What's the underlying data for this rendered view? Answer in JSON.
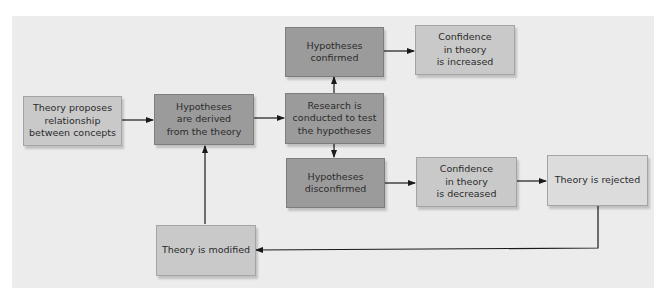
{
  "diagram": {
    "type": "flowchart",
    "colors": {
      "panel_background": "#ececec",
      "light_box": "#c9c9c9",
      "dark_box": "#9b9b9b",
      "lighter_box": "#dcdcdc",
      "arrow": "#1a1a1a",
      "text": "#2b2b2b"
    },
    "nodes": [
      {
        "id": "theory_proposes",
        "label": "Theory proposes\nrelationship\nbetween concepts",
        "style": "light"
      },
      {
        "id": "hypotheses_derived",
        "label": "Hypotheses\nare derived\nfrom the theory",
        "style": "dark"
      },
      {
        "id": "research_conducted",
        "label": "Research is\nconducted to test\nthe hypotheses",
        "style": "dark"
      },
      {
        "id": "hypotheses_confirmed",
        "label": "Hypotheses\nconfirmed",
        "style": "dark"
      },
      {
        "id": "confidence_increased",
        "label": "Confidence\nin theory\nis increased",
        "style": "light"
      },
      {
        "id": "hypotheses_disconfirmed",
        "label": "Hypotheses\ndisconfirmed",
        "style": "dark"
      },
      {
        "id": "confidence_decreased",
        "label": "Confidence\nin theory\nis decreased",
        "style": "light"
      },
      {
        "id": "theory_rejected",
        "label": "Theory is rejected",
        "style": "lighter"
      },
      {
        "id": "theory_modified",
        "label": "Theory is modified",
        "style": "light"
      }
    ],
    "edges": [
      {
        "from": "theory_proposes",
        "to": "hypotheses_derived"
      },
      {
        "from": "hypotheses_derived",
        "to": "research_conducted"
      },
      {
        "from": "research_conducted",
        "to": "hypotheses_confirmed"
      },
      {
        "from": "research_conducted",
        "to": "hypotheses_disconfirmed"
      },
      {
        "from": "hypotheses_confirmed",
        "to": "confidence_increased"
      },
      {
        "from": "hypotheses_disconfirmed",
        "to": "confidence_decreased"
      },
      {
        "from": "confidence_decreased",
        "to": "theory_rejected"
      },
      {
        "from": "theory_rejected",
        "to": "theory_modified"
      },
      {
        "from": "theory_modified",
        "to": "hypotheses_derived"
      }
    ]
  }
}
